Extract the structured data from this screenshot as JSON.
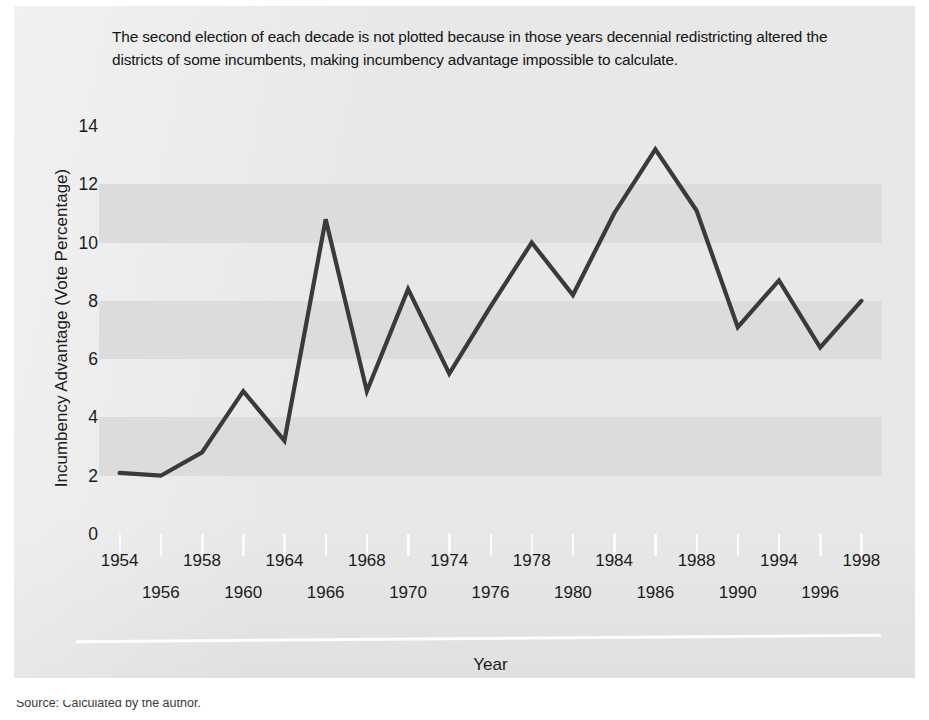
{
  "note": "The second election of each decade is not plotted because in those years decennial redistricting altered the districts of some incumbents, making incumbency advantage impossible to calculate.",
  "source_text": "Source: Calculated by the author.",
  "colors": {
    "line": "#3a3a3a",
    "band": "#dcdcdc",
    "paper": "#e8e8e8",
    "text": "#1b1b1b"
  },
  "chart_data": {
    "type": "line",
    "title": "",
    "xlabel": "Year",
    "ylabel": "Incumbency Advantage (Vote Percentage)",
    "xlim": [
      1954,
      1998
    ],
    "ylim": [
      0,
      14
    ],
    "yticks": [
      0,
      2,
      4,
      6,
      8,
      10,
      12,
      14
    ],
    "ytick_labels": [
      "0",
      "2",
      "4",
      "6",
      "8",
      "10",
      "12",
      "14"
    ],
    "xticks": [
      1954,
      1956,
      1958,
      1960,
      1964,
      1966,
      1968,
      1970,
      1974,
      1976,
      1978,
      1980,
      1984,
      1986,
      1988,
      1990,
      1994,
      1996,
      1998
    ],
    "xtick_labels": [
      "1954",
      "1956",
      "1958",
      "1960",
      "1964",
      "1966",
      "1968",
      "1970",
      "1974",
      "1976",
      "1978",
      "1980",
      "1984",
      "1986",
      "1988",
      "1990",
      "1994",
      "1996",
      "1998"
    ],
    "grid": "alternating horizontal bands every 2 units",
    "legend": "none",
    "x": [
      1954,
      1956,
      1958,
      1960,
      1964,
      1966,
      1968,
      1970,
      1974,
      1976,
      1978,
      1980,
      1984,
      1986,
      1988,
      1990,
      1994,
      1996,
      1998
    ],
    "values": [
      2.1,
      2.0,
      2.8,
      4.9,
      3.2,
      10.8,
      4.9,
      8.4,
      5.5,
      7.8,
      10.0,
      8.2,
      11.0,
      13.2,
      11.1,
      7.1,
      8.7,
      6.4,
      8.0
    ],
    "series": [
      {
        "name": "Incumbency advantage",
        "values": [
          2.1,
          2.0,
          2.8,
          4.9,
          3.2,
          10.8,
          4.9,
          8.4,
          5.5,
          7.8,
          10.0,
          8.2,
          11.0,
          13.2,
          11.1,
          7.1,
          8.7,
          6.4,
          8.0
        ]
      }
    ],
    "annotations": [
      "Second election of each decade (1962, 1972, 1982, 1992) omitted"
    ]
  },
  "axis": {
    "y_title": "Incumbency Advantage (Vote Percentage)",
    "x_title": "Year"
  }
}
